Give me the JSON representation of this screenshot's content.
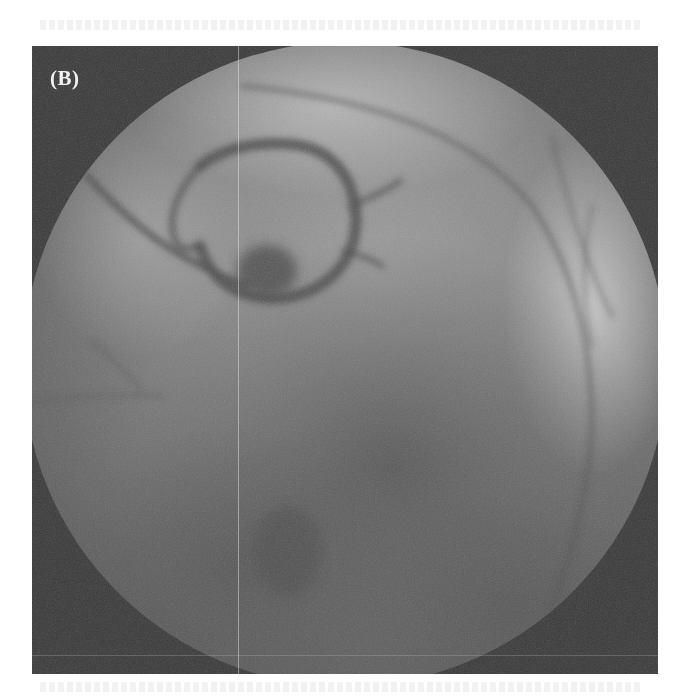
{
  "figure": {
    "panel_label": "(B)",
    "image_type": "fluoroscopic coronary angiogram",
    "colors": {
      "background": "#ffffff",
      "collimator_mask": "#3a3a3a",
      "field_light": "#a9a9a9",
      "field_mid": "#7e7e7e",
      "field_dark": "#5a5a5a",
      "vessel": "#4e4e4e",
      "label": "#f2f2f2"
    }
  }
}
